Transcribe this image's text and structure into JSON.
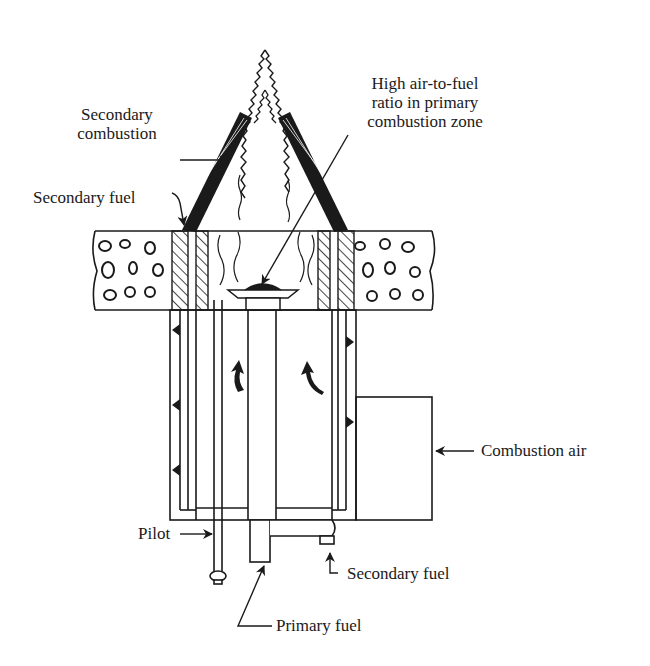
{
  "diagram": {
    "type": "staged-fuel burner cross-section",
    "labels": {
      "high_air_ratio_line1": "High air-to-fuel",
      "high_air_ratio_line2": "ratio in primary",
      "high_air_ratio_line3": "combustion zone",
      "secondary_combustion_line1": "Secondary",
      "secondary_combustion_line2": "combustion",
      "secondary_fuel_top": "Secondary fuel",
      "combustion_air": "Combustion air",
      "pilot": "Pilot",
      "secondary_fuel_bottom": "Secondary fuel",
      "primary_fuel": "Primary fuel"
    },
    "colors": {
      "ink": "#1a1a1a",
      "background": "#ffffff"
    }
  }
}
